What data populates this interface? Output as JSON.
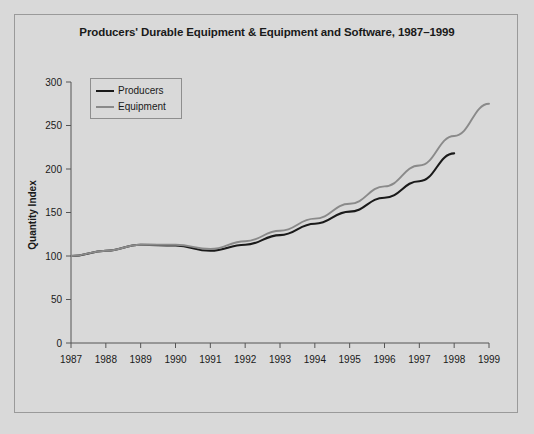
{
  "chart_data": {
    "type": "line",
    "title": "Producers' Durable Equipment & Equipment and Software, 1987–1999",
    "xlabel": "",
    "ylabel": "Quantity Index",
    "x": [
      1987,
      1988,
      1989,
      1990,
      1991,
      1992,
      1993,
      1994,
      1995,
      1996,
      1997,
      1998,
      1999
    ],
    "xtick_labels": [
      "1987",
      "1988",
      "1989",
      "1990",
      "1991",
      "1992",
      "1993",
      "1994",
      "1995",
      "1996",
      "1997",
      "1998",
      "1999"
    ],
    "ytick_labels": [
      "0",
      "50",
      "100",
      "150",
      "200",
      "250",
      "300"
    ],
    "yticks": [
      0,
      50,
      100,
      150,
      200,
      250,
      300
    ],
    "ylim": [
      0,
      300
    ],
    "xlim": [
      1987,
      1999
    ],
    "grid": false,
    "legend_position": "upper-left-inside",
    "series": [
      {
        "name": "Producers",
        "color": "#1a1a1a",
        "values": [
          100,
          106,
          113,
          112,
          106,
          113,
          124,
          137,
          151,
          167,
          186,
          218,
          null
        ]
      },
      {
        "name": "Equipment",
        "color": "#8a8a8a",
        "values": [
          100,
          106,
          113,
          113,
          108,
          117,
          129,
          143,
          160,
          180,
          204,
          238,
          275
        ]
      }
    ]
  },
  "legend": {
    "items": [
      {
        "label": "Producers",
        "color": "#1a1a1a"
      },
      {
        "label": "Equipment",
        "color": "#8a8a8a"
      }
    ]
  },
  "colors": {
    "background": "#d9d9d9",
    "frame": "#9a9a9a",
    "axis": "#555555",
    "text": "#1a1a1a",
    "producers": "#1a1a1a",
    "equipment": "#8a8a8a"
  }
}
